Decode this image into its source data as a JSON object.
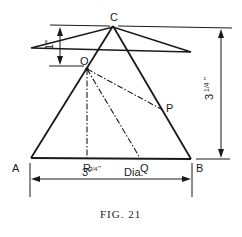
{
  "figure": {
    "caption": "FIG. 21",
    "points": {
      "A": "A",
      "B": "B",
      "C": "C",
      "O": "O",
      "P": "P",
      "Q": "Q",
      "R": "R"
    },
    "dimensions": {
      "top_offset": "1\"",
      "height_whole": "3",
      "height_frac": "1/4",
      "height_unit": "\"",
      "base_whole": "3",
      "base_frac": "3/4",
      "base_unit": "\"",
      "base_suffix": "Dia."
    },
    "colors": {
      "ink": "#1a1a1a",
      "background": "#ffffff"
    }
  }
}
